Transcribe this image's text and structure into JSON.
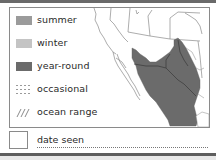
{
  "legend": {
    "items": [
      {
        "key": "summer",
        "label": "summer",
        "color": "#9b9b9b",
        "pattern": "solid"
      },
      {
        "key": "winter",
        "label": "winter",
        "color": "#c4c4c4",
        "pattern": "solid"
      },
      {
        "key": "year_round",
        "label": "year-round",
        "color": "#6b6b6b",
        "pattern": "solid"
      },
      {
        "key": "occasional",
        "label": "occasional",
        "color": "#9a9a9a",
        "pattern": "dotted"
      },
      {
        "key": "ocean_range",
        "label": "ocean range",
        "color": "#8a8a8a",
        "pattern": "hatched"
      }
    ]
  },
  "map": {
    "region": "Southwestern United States and Mexico",
    "range_type_shown": "year-round",
    "range_color": "#6b6b6b",
    "border_color": "#555555",
    "coast_color": "#777777"
  },
  "date_seen": {
    "label": "date seen",
    "value": ""
  }
}
